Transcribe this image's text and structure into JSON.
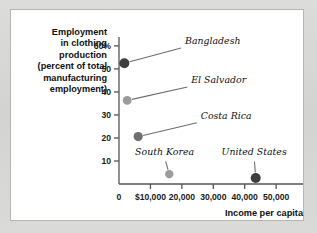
{
  "chart_data": {
    "type": "scatter",
    "title": "",
    "ylabel_lines": [
      "Employment",
      "in clothing",
      "production",
      "(percent of total",
      "manufacturing",
      "employment)"
    ],
    "ylabel": "Employment in clothing production (percent of total manufacturing employment)",
    "xlabel": "Income per capita",
    "xlim": [
      0,
      56000
    ],
    "ylim": [
      0,
      63
    ],
    "grid": false,
    "legend": "none",
    "xticks": [
      0,
      10000,
      20000,
      30000,
      40000,
      50000
    ],
    "xtick_labels": [
      "0",
      "$10,000",
      "20,000",
      "30,000",
      "40,000",
      "50,000"
    ],
    "yticks": [
      10,
      20,
      30,
      40,
      50,
      60
    ],
    "ytick_labels": [
      "10",
      "20",
      "30",
      "40",
      "50",
      "60%"
    ],
    "points": [
      {
        "name": "Bangladesh",
        "x": 1700,
        "y": 52.5,
        "color": "#3d3d3d",
        "radius": 5.0,
        "label_x": 21000,
        "label_y": 59.5,
        "label_anchor": "start"
      },
      {
        "name": "El Salvador",
        "x": 2600,
        "y": 36.3,
        "color": "#9b9b9b",
        "radius": 4.4,
        "label_x": 23000,
        "label_y": 42.5,
        "label_anchor": "start"
      },
      {
        "name": "Costa Rica",
        "x": 6100,
        "y": 20.6,
        "color": "#6f6f6f",
        "radius": 4.6,
        "label_x": 26000,
        "label_y": 27.0,
        "label_anchor": "start"
      },
      {
        "name": "South Korea",
        "x": 16000,
        "y": 4.3,
        "color": "#9b9b9b",
        "radius": 4.2,
        "label_x": 14500,
        "label_y": 11.5,
        "label_anchor": "middle"
      },
      {
        "name": "United States",
        "x": 43500,
        "y": 2.6,
        "color": "#3d3d3d",
        "radius": 5.0,
        "label_x": 43000,
        "label_y": 11.5,
        "label_anchor": "middle"
      }
    ]
  },
  "colors": {
    "page_background": "#d8d8d6",
    "card_background": "#ffffff",
    "card_border": "#b6b6b4",
    "axis": "#555555",
    "text": "#111111",
    "dot_dark": "#3d3d3d",
    "dot_mid": "#6f6f6f",
    "dot_light": "#9b9b9b"
  }
}
